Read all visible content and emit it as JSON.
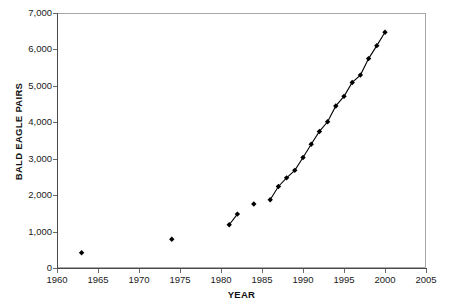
{
  "chart_data": {
    "type": "line",
    "title": "",
    "subtitle": "",
    "xlabel": "YEAR",
    "ylabel": "BALD EAGLE PAIRS",
    "xlim": [
      1960,
      2005
    ],
    "ylim": [
      0,
      7000
    ],
    "x_tick_labels": [
      "1960",
      "1965",
      "1970",
      "1975",
      "1980",
      "1985",
      "1990",
      "1995",
      "2000",
      "2005"
    ],
    "x_ticks": [
      1960,
      1965,
      1970,
      1975,
      1980,
      1985,
      1990,
      1995,
      2000,
      2005
    ],
    "y_tick_labels": [
      "0",
      "1,000",
      "2,000",
      "3,000",
      "4,000",
      "5,000",
      "6,000",
      "7,000"
    ],
    "y_ticks": [
      0,
      1000,
      2000,
      3000,
      4000,
      5000,
      6000,
      7000
    ],
    "grid": false,
    "legend": false,
    "legend_position": "none",
    "marker": "diamond",
    "marker_color": "#000000",
    "line_color": "#000000",
    "frame_color": "#a7a7a7",
    "background": "#ffffff",
    "series": [
      {
        "name": "Bald eagle breeding pairs",
        "x": [
          1963,
          1974,
          1981,
          1982,
          1984,
          1986,
          1987,
          1988,
          1989,
          1990,
          1991,
          1992,
          1993,
          1994,
          1995,
          1996,
          1997,
          1998,
          1999,
          2000
        ],
        "values": [
          417,
          791,
          1188,
          1480,
          1757,
          1875,
          2238,
          2475,
          2680,
          3035,
          3399,
          3749,
          4015,
          4449,
          4712,
          5094,
          5295,
          5748,
          6104,
          6471
        ],
        "segments": [
          {
            "x": [
              1963
            ],
            "values": [
              417
            ]
          },
          {
            "x": [
              1974
            ],
            "values": [
              791
            ]
          },
          {
            "x": [
              1981,
              1982
            ],
            "values": [
              1188,
              1480
            ]
          },
          {
            "x": [
              1984
            ],
            "values": [
              1757
            ]
          },
          {
            "x": [
              1986,
              1987,
              1988,
              1989,
              1990,
              1991,
              1992,
              1993,
              1994,
              1995,
              1996,
              1997,
              1998,
              1999,
              2000
            ],
            "values": [
              1875,
              2238,
              2475,
              2680,
              3035,
              3399,
              3749,
              4015,
              4449,
              4712,
              5094,
              5295,
              5748,
              6104,
              6471
            ]
          }
        ]
      }
    ]
  },
  "top_sliver": {
    "text": ""
  }
}
